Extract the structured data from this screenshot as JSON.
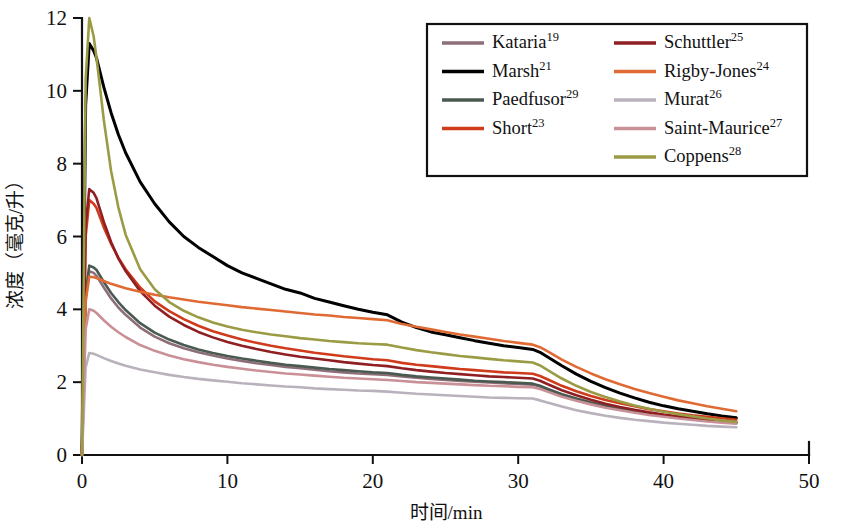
{
  "chart_data": {
    "type": "line",
    "title": "",
    "xlabel": "时间/min",
    "ylabel": "浓度（毫克/升）",
    "xlim": [
      0,
      50
    ],
    "ylim": [
      0,
      12
    ],
    "xticks": [
      0,
      10,
      20,
      30,
      40,
      50
    ],
    "yticks": [
      0,
      2,
      4,
      6,
      8,
      10,
      12
    ],
    "xtick_labels": [
      "0",
      "10",
      "20",
      "30",
      "40",
      "50"
    ],
    "ytick_labels": [
      "0",
      "2",
      "4",
      "6",
      "8",
      "10",
      "12"
    ],
    "grid": false,
    "legend_position": "top-right",
    "x": [
      0,
      0.25,
      0.5,
      0.8,
      1,
      1.5,
      2,
      2.5,
      3,
      4,
      5,
      6,
      7,
      8,
      9,
      10,
      11,
      12,
      13,
      14,
      15,
      16,
      17,
      18,
      19,
      20,
      21,
      22,
      23,
      24,
      25,
      26,
      27,
      28,
      29,
      30,
      31,
      31.5,
      32,
      33,
      34,
      35,
      36,
      37,
      38,
      39,
      40,
      41,
      42,
      43,
      44,
      45
    ],
    "series": [
      {
        "name": "Kataria",
        "superscript": "19",
        "color": "#8d6e79",
        "values": [
          0,
          4.3,
          5.05,
          5.0,
          4.92,
          4.6,
          4.3,
          4.05,
          3.85,
          3.5,
          3.25,
          3.07,
          2.93,
          2.82,
          2.73,
          2.65,
          2.58,
          2.52,
          2.47,
          2.42,
          2.38,
          2.34,
          2.3,
          2.27,
          2.24,
          2.22,
          2.2,
          2.16,
          2.12,
          2.09,
          2.06,
          2.03,
          2.01,
          1.99,
          1.97,
          1.95,
          1.93,
          1.88,
          1.8,
          1.66,
          1.54,
          1.44,
          1.35,
          1.27,
          1.2,
          1.14,
          1.08,
          1.03,
          0.99,
          0.95,
          0.91,
          0.88
        ]
      },
      {
        "name": "Marsh",
        "superscript": "21",
        "color": "#000000",
        "values": [
          0,
          9.6,
          11.3,
          11.1,
          10.9,
          10.1,
          9.4,
          8.8,
          8.3,
          7.5,
          6.9,
          6.4,
          6.0,
          5.7,
          5.45,
          5.2,
          5.0,
          4.85,
          4.7,
          4.55,
          4.45,
          4.3,
          4.2,
          4.1,
          4.0,
          3.92,
          3.85,
          3.65,
          3.5,
          3.38,
          3.3,
          3.22,
          3.14,
          3.07,
          3.0,
          2.95,
          2.9,
          2.82,
          2.7,
          2.45,
          2.22,
          2.02,
          1.85,
          1.7,
          1.57,
          1.45,
          1.35,
          1.27,
          1.2,
          1.13,
          1.07,
          1.02
        ]
      },
      {
        "name": "Paedfusor",
        "superscript": "29",
        "color": "#4a5a50",
        "values": [
          0,
          4.45,
          5.2,
          5.15,
          5.08,
          4.75,
          4.45,
          4.2,
          3.98,
          3.62,
          3.36,
          3.17,
          3.02,
          2.9,
          2.8,
          2.72,
          2.65,
          2.59,
          2.53,
          2.48,
          2.44,
          2.4,
          2.36,
          2.33,
          2.3,
          2.27,
          2.25,
          2.2,
          2.16,
          2.13,
          2.1,
          2.07,
          2.04,
          2.02,
          2.0,
          1.98,
          1.96,
          1.9,
          1.82,
          1.67,
          1.55,
          1.44,
          1.35,
          1.27,
          1.2,
          1.14,
          1.08,
          1.03,
          0.99,
          0.95,
          0.91,
          0.88
        ]
      },
      {
        "name": "Short",
        "superscript": "23",
        "color": "#cf3b1b",
        "values": [
          0,
          6.0,
          7.0,
          6.9,
          6.78,
          6.25,
          5.8,
          5.42,
          5.1,
          4.6,
          4.22,
          3.95,
          3.73,
          3.55,
          3.4,
          3.28,
          3.17,
          3.08,
          3.0,
          2.93,
          2.87,
          2.81,
          2.76,
          2.71,
          2.67,
          2.63,
          2.6,
          2.53,
          2.48,
          2.44,
          2.4,
          2.36,
          2.33,
          2.3,
          2.27,
          2.25,
          2.23,
          2.17,
          2.08,
          1.9,
          1.75,
          1.62,
          1.51,
          1.42,
          1.34,
          1.26,
          1.2,
          1.14,
          1.09,
          1.05,
          1.01,
          0.97
        ]
      },
      {
        "name": "Schuttler",
        "superscript": "25",
        "color": "#8f1f23",
        "values": [
          0,
          6.3,
          7.3,
          7.2,
          7.05,
          6.4,
          5.85,
          5.4,
          5.05,
          4.5,
          4.1,
          3.8,
          3.57,
          3.38,
          3.23,
          3.1,
          3.0,
          2.91,
          2.83,
          2.76,
          2.7,
          2.65,
          2.6,
          2.55,
          2.51,
          2.47,
          2.44,
          2.38,
          2.33,
          2.29,
          2.25,
          2.22,
          2.19,
          2.16,
          2.14,
          2.12,
          2.1,
          2.04,
          1.95,
          1.78,
          1.64,
          1.52,
          1.41,
          1.32,
          1.24,
          1.17,
          1.11,
          1.06,
          1.01,
          0.97,
          0.93,
          0.9
        ]
      },
      {
        "name": "Rigby-Jones",
        "superscript": "24",
        "color": "#e06a33",
        "values": [
          0,
          4.2,
          4.9,
          4.88,
          4.86,
          4.78,
          4.7,
          4.64,
          4.58,
          4.48,
          4.4,
          4.33,
          4.27,
          4.21,
          4.16,
          4.11,
          4.06,
          4.02,
          3.98,
          3.94,
          3.9,
          3.86,
          3.83,
          3.79,
          3.76,
          3.73,
          3.7,
          3.6,
          3.52,
          3.45,
          3.38,
          3.31,
          3.25,
          3.19,
          3.13,
          3.08,
          3.03,
          2.96,
          2.85,
          2.62,
          2.42,
          2.24,
          2.08,
          1.94,
          1.81,
          1.7,
          1.6,
          1.5,
          1.42,
          1.34,
          1.27,
          1.2
        ]
      },
      {
        "name": "Murat",
        "superscript": "26",
        "color": "#b9b2bd",
        "values": [
          0,
          2.4,
          2.8,
          2.78,
          2.75,
          2.66,
          2.58,
          2.51,
          2.45,
          2.35,
          2.27,
          2.2,
          2.14,
          2.09,
          2.05,
          2.01,
          1.97,
          1.94,
          1.91,
          1.88,
          1.86,
          1.83,
          1.81,
          1.79,
          1.77,
          1.76,
          1.74,
          1.71,
          1.68,
          1.66,
          1.64,
          1.62,
          1.6,
          1.58,
          1.57,
          1.56,
          1.55,
          1.5,
          1.44,
          1.33,
          1.23,
          1.15,
          1.08,
          1.02,
          0.97,
          0.93,
          0.89,
          0.86,
          0.83,
          0.8,
          0.78,
          0.76
        ]
      },
      {
        "name": "Saint-Maurice",
        "superscript": "27",
        "color": "#c99097",
        "values": [
          0,
          3.45,
          4.0,
          3.96,
          3.9,
          3.7,
          3.52,
          3.37,
          3.24,
          3.02,
          2.86,
          2.73,
          2.63,
          2.55,
          2.48,
          2.42,
          2.37,
          2.32,
          2.28,
          2.24,
          2.21,
          2.18,
          2.15,
          2.12,
          2.1,
          2.08,
          2.06,
          2.03,
          2.0,
          1.98,
          1.96,
          1.94,
          1.92,
          1.9,
          1.89,
          1.87,
          1.86,
          1.81,
          1.74,
          1.6,
          1.49,
          1.39,
          1.3,
          1.23,
          1.16,
          1.1,
          1.05,
          1.0,
          0.96,
          0.92,
          0.89,
          0.86
        ]
      },
      {
        "name": "Coppens",
        "superscript": "28",
        "color": "#9b9b45",
        "values": [
          0,
          10.3,
          12.0,
          11.5,
          10.9,
          9.2,
          7.8,
          6.8,
          6.05,
          5.1,
          4.55,
          4.2,
          3.96,
          3.78,
          3.64,
          3.53,
          3.44,
          3.37,
          3.31,
          3.26,
          3.21,
          3.17,
          3.13,
          3.1,
          3.07,
          3.05,
          3.03,
          2.95,
          2.88,
          2.82,
          2.77,
          2.72,
          2.68,
          2.64,
          2.6,
          2.57,
          2.54,
          2.46,
          2.34,
          2.1,
          1.9,
          1.73,
          1.59,
          1.47,
          1.36,
          1.27,
          1.19,
          1.12,
          1.06,
          1.0,
          0.95,
          0.91
        ]
      }
    ]
  },
  "legend": {
    "columns": [
      [
        {
          "label": "Kataria",
          "sup": "19",
          "color": "#8d6e79"
        },
        {
          "label": "Marsh",
          "sup": "21",
          "color": "#000000"
        },
        {
          "label": "Paedfusor",
          "sup": "29",
          "color": "#4a5a50"
        },
        {
          "label": "Short",
          "sup": "23",
          "color": "#cf3b1b"
        }
      ],
      [
        {
          "label": "Schuttler",
          "sup": "25",
          "color": "#8f1f23"
        },
        {
          "label": "Rigby-Jones",
          "sup": "24",
          "color": "#e06a33"
        },
        {
          "label": "Murat",
          "sup": "26",
          "color": "#b9b2bd"
        },
        {
          "label": "Saint-Maurice",
          "sup": "27",
          "color": "#c99097"
        },
        {
          "label": "Coppens",
          "sup": "28",
          "color": "#9b9b45"
        }
      ]
    ]
  }
}
